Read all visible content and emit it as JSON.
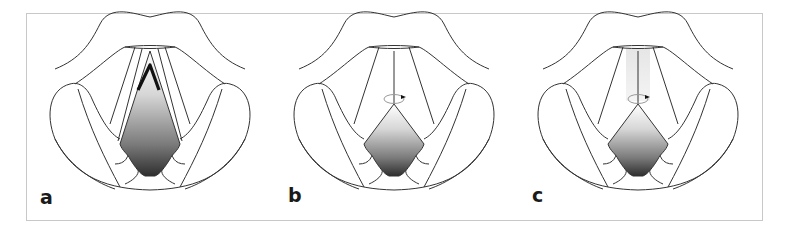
{
  "figure": {
    "panels": [
      {
        "id": "a",
        "label": "a",
        "annotation": "bold inverted-V marker at anterior commissure"
      },
      {
        "id": "b",
        "label": "b",
        "annotation": "midline line with circular rotation arrow"
      },
      {
        "id": "c",
        "label": "c",
        "annotation": "shaded midline band with circular rotation arrow"
      }
    ],
    "colors": {
      "outline": "#333333",
      "frame": "#c8c8c8",
      "gradient_light": "#ffffff",
      "gradient_dark": "#3a3a3a",
      "arrow_circle": "#999999"
    }
  }
}
